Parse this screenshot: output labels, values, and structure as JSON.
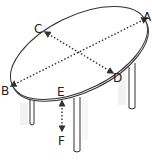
{
  "diagram": {
    "labels": {
      "a": "A",
      "b": "B",
      "c": "C",
      "d": "D",
      "e": "E",
      "f": "F"
    },
    "dimensions": [
      {
        "from": "A",
        "to": "B",
        "meaning": "length"
      },
      {
        "from": "C",
        "to": "D",
        "meaning": "width"
      },
      {
        "from": "E",
        "to": "F",
        "meaning": "height"
      }
    ],
    "colors": {
      "line": "#333333",
      "leg_shadow": "#d8d8d8"
    }
  }
}
